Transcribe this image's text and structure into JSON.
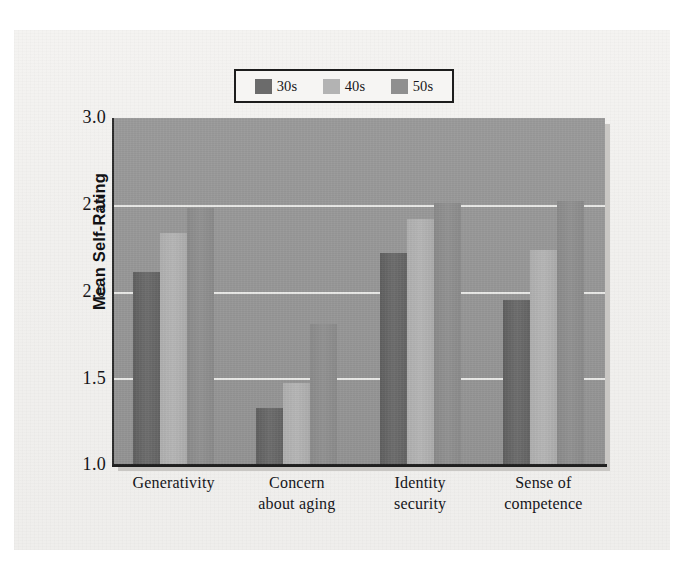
{
  "chart_data": {
    "type": "bar",
    "title": "",
    "xlabel": "",
    "ylabel": "Mean Self-Rating",
    "categories": [
      "Generativity",
      "Concern about aging",
      "Identity security",
      "Sense of competence"
    ],
    "category_lines": [
      [
        "Generativity"
      ],
      [
        "Concern",
        "about aging"
      ],
      [
        "Identity",
        "security"
      ],
      [
        "Sense of",
        "competence"
      ]
    ],
    "series": [
      {
        "name": "30s",
        "color": "#6b6b6b",
        "values": [
          2.11,
          1.33,
          2.22,
          1.95
        ]
      },
      {
        "name": "40s",
        "color": "#b3b3b3",
        "values": [
          2.34,
          1.47,
          2.42,
          2.24
        ]
      },
      {
        "name": "50s",
        "color": "#8f8f8f",
        "values": [
          2.48,
          1.81,
          2.51,
          2.52
        ]
      }
    ],
    "ylim": [
      1.0,
      3.0
    ],
    "yticks": [
      "1.0",
      "1.5",
      "2.0",
      "2.5",
      "3.0"
    ],
    "ytick_values": [
      1.0,
      1.5,
      2.0,
      2.5,
      3.0
    ],
    "grid": true,
    "gridline_values": [
      1.5,
      2.0,
      2.5
    ],
    "legend_position": "top-center",
    "plot_background": "#969696",
    "gridline_color": "#e9e9e7",
    "page_background": "#f1f0ee"
  },
  "legend": {
    "entries": [
      {
        "label": "30s",
        "color": "#6b6b6b"
      },
      {
        "label": "40s",
        "color": "#b3b3b3"
      },
      {
        "label": "50s",
        "color": "#8f8f8f"
      }
    ]
  },
  "axes": {
    "y_label": "Mean Self-Rating",
    "y_ticks": [
      "3.0",
      "2.5",
      "2.0",
      "1.5",
      "1.0"
    ]
  }
}
